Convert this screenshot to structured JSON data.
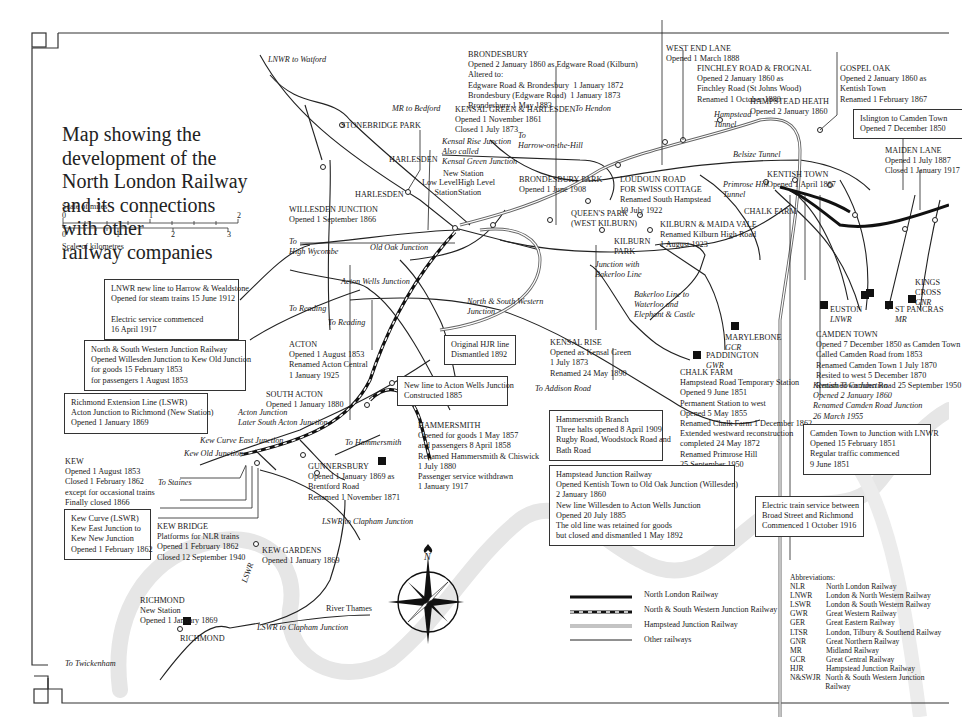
{
  "title": [
    "Map showing the",
    "development of the",
    "North London Railway",
    "and its connections",
    "with other",
    "railway companies"
  ],
  "scale": {
    "miles_label": "Scale of miles",
    "miles_ticks": [
      "0",
      "1",
      "2"
    ],
    "km_ticks": [
      "0",
      "1",
      "2",
      "3"
    ],
    "km_label": "Scale of kilometres"
  },
  "directions": {
    "lnwr_watford": "LNWR to Watford",
    "mr_bedford": "MR to Bedford",
    "to_hendon": "To Hendon",
    "to_harrow": "To\nHarrow-on-the-Hill",
    "to_high_wycombe": "To\nHigh Wycombe",
    "to_reading_1": "To Reading",
    "to_reading_2": "To Reading",
    "to_addison": "To Addison Road",
    "to_hammersmith": "To Hammersmith",
    "to_staines": "To Staines",
    "lswr_clapham_1": "LSWR to Clapham Junction",
    "lswr_clapham_2": "LSWR to Clapham Junction",
    "to_twickenham": "To Twickenham",
    "lswr_line": "LSWR",
    "bakerloo_waterloo": "Bakerloo Line to\nWaterloo and\nElephant & Castle",
    "junction_bakerloo": "Junction with\nBakerloo Line",
    "river": "River Thames",
    "compass_n": "N"
  },
  "junctions": {
    "kensal_rise_jn": "Kensal Rise Junction\nAlso called\nKensal Green Junction",
    "old_oak": "Old Oak Junction",
    "acton_wells": "Acton Wells Junction",
    "nsw_jn": "North & South Western\nJunction",
    "acton_jn": "Acton Junction\nLater South Acton Junction",
    "kew_curve_east": "Kew Curve East Junction",
    "kew_old": "Kew Old Junction",
    "hampstead_tunnel": "Hampstead\nTunnel",
    "belsize_tunnel": "Belsize Tunnel",
    "primrose_tunnel": "Primrose Hill\nTunnel",
    "kentish_town_jn": "Kentish Town Junction\nOpened 2 January 1860\nRenamed Camden Road Junction\n26 March 1955"
  },
  "stations": {
    "brondesbury": {
      "name": "BRONDESBURY",
      "text": "Opened 2 January 1860 as Edgware Road (Kilburn)\nAltered to:\nEdgware Road & Brondesbury  1 January 1872\nBrondesbury (Edgware Road)  1 January 1873\nBrondesbury 1 May 1883"
    },
    "west_end_lane": {
      "name": "WEST END LANE",
      "text": "Opened 1 March 1888"
    },
    "finchley_road": {
      "name": "FINCHLEY ROAD & FROGNAL",
      "text": "Opened 2 January 1860 as\nFinchley Road (St Johns Wood)\nRenamed 1 October 1880"
    },
    "gospel_oak": {
      "name": "GOSPEL OAK",
      "text": "Opened 2 January 1860 as\nKentish Town\nRenamed 1 February 1867"
    },
    "hampstead_heath": {
      "name": "HAMPSTEAD HEATH",
      "text": "Opened 2 January 1860"
    },
    "kensal_green": {
      "name": "KENSAL GREEN & HARLESDEN",
      "text": "Opened 1 November 1861\nClosed 1 July 1873"
    },
    "stonebridge": {
      "name": "STONEBRIDGE PARK",
      "text": ""
    },
    "harlesden_1": {
      "name": "HARLESDEN",
      "text": ""
    },
    "harlesden_2": {
      "name": "HARLESDEN",
      "text": ""
    },
    "new_station": {
      "name": "New Station",
      "text": ""
    },
    "low_level": {
      "name": "Low Level\nStation",
      "text": ""
    },
    "high_level": {
      "name": "High Level\nStation",
      "text": ""
    },
    "willesden": {
      "name": "WILLESDEN JUNCTION",
      "text": "Opened 1 September 1866"
    },
    "brondesbury_park": {
      "name": "BRONDESBURY PARK",
      "text": "Opened 1 June 1908"
    },
    "loudoun": {
      "name": "LOUDOUN ROAD\nFOR SWISS COTTAGE",
      "text": "Renamed South Hampstead\n10 July 1922"
    },
    "queens_park": {
      "name": "QUEEN'S PARK\n(WEST KILBURN)",
      "text": ""
    },
    "kilburn_park": {
      "name": "KILBURN\nPARK",
      "text": ""
    },
    "kilburn_maida": {
      "name": "KILBURN & MAIDA VALE",
      "text": "Renamed Kilburn High Road\n1 August 1923"
    },
    "kentish_town": {
      "name": "KENTISH TOWN",
      "text": "Opened 1 April 1867"
    },
    "chalk_farm_top": {
      "name": "CHALK FARM",
      "text": ""
    },
    "maiden_lane": {
      "name": "MAIDEN LANE",
      "text": "Opened 1 July 1887\nClosed 1 January 1917"
    },
    "kings_cross": {
      "name": "KINGS\nCROSS",
      "co": "GNR"
    },
    "st_pancras": {
      "name": "ST PANCRAS",
      "co": "MR"
    },
    "euston": {
      "name": "EUSTON",
      "co": "LNWR"
    },
    "marylebone": {
      "name": "MARYLEBONE",
      "co": "GCR"
    },
    "paddington": {
      "name": "PADDINGTON",
      "co": "GWR"
    },
    "camden_town": {
      "name": "CAMDEN TOWN",
      "text": "Opened 7 December 1850 as Camden Town\nCalled Camden Road from 1853\nRenamed Camden Town 1 July 1870\nResited to west 5 December 1870\nRenamed Camden Road 25 September 1950"
    },
    "chalk_farm": {
      "name": "CHALK FARM",
      "text": "Hampstead Road Temporary Station\nOpened 9 June 1851\nPermanent Station to west\nOpened 5 May 1855\nRenamed Chalk Farm 1 December 1862\nExtended westward reconstruction\ncompleted 24 May 1872\nRenamed Primrose Hill\n25 September 1950"
    },
    "kensal_rise": {
      "name": "KENSAL RISE",
      "text": "Opened as Kensal Green\n1 July 1873\nRenamed 24 May 1890"
    },
    "acton": {
      "name": "ACTON",
      "text": "Opened 1 August 1853\nRenamed Acton Central\n1 January 1925"
    },
    "south_acton": {
      "name": "SOUTH ACTON",
      "text": "Opened 1 January 1880"
    },
    "hammersmith": {
      "name": "HAMMERSMITH",
      "text": "Opened for goods 1 May 1857\nand passengers 8 April 1858\nRenamed Hammersmith & Chiswick\n1 July 1880\nPassenger service withdrawn\n1 January 1917"
    },
    "gunnersbury": {
      "name": "GUNNERSBURY",
      "text": "Opened 1 January 1869 as\nBrentford Road\nRenamed 1 November 1871"
    },
    "kew": {
      "name": "KEW",
      "text": "Opened 1 August 1853\nClosed 1 February 1862\nexcept for occasional trains\nFinally closed 1866"
    },
    "kew_bridge": {
      "name": "KEW BRIDGE",
      "text": "Platforms for NLR trains\nOpened 1 February 1862\nClosed 12 September 1940"
    },
    "kew_gardens": {
      "name": "KEW GARDENS",
      "text": "Opened 1 January 1869"
    },
    "richmond_new": {
      "name": "RICHMOND",
      "text": "New Station\nOpened 1 January 1869"
    },
    "richmond": {
      "name": "RICHMOND",
      "text": ""
    }
  },
  "boxes": {
    "lnwr_harrow": "LNWR new line to Harrow & Wealdstone\nOpened for steam trains 15 June 1912\n\nElectric service commenced\n16 April 1917",
    "nswjr": "North & South Western Junction Railway\nOpened Willesden Junction to Kew Old Junction\nfor goods 15 February 1853\nfor passengers 1 August 1853",
    "richmond_ext": "Richmond Extension Line (LSWR)\nActon Junction to Richmond (New Station)\nOpened 1 January 1869",
    "kew_curve": "Kew Curve (LSWR)\nKew East Junction to\nKew New Junction\nOpened 1 February 1862",
    "original_hjr": "Original HJR line\nDismantled 1892",
    "new_line_acton": "New line to Acton Wells Junction\nConstructed 1885",
    "hammersmith_branch": "Hammersmith Branch\nThree halts opened 8 April 1909\nRugby Road, Woodstock Road and\nBath Road",
    "hampstead_jr": "Hampstead Junction Railway\nOpened Kentish Town to Old Oak Junction (Willesden)\n2 January 1860\nNew line Willesden to Acton Wells Junction\nOpened 20 July 1885\nThe old line was retained for goods\nbut closed and dismantled 1 May 1892",
    "islington": "Islington to Camden Town\nOpened 7 December 1850",
    "camden_lnwr": "Camden Town to Junction with LNWR\nOpened 15 February 1851\nRegular traffic commenced\n9 June 1851",
    "electric": "Electric train service between\nBroad Street and Richmond\nCommenced 1 October 1916"
  },
  "legend": [
    {
      "label": "North London Railway",
      "style": "thick-black"
    },
    {
      "label": "North & South Western Junction Railway",
      "style": "dashed-black"
    },
    {
      "label": "Hampstead Junction Railway",
      "style": "double-grey"
    },
    {
      "label": "Other railways",
      "style": "thin-black"
    }
  ],
  "abbreviations": {
    "title": "Abbreviations:",
    "items": [
      {
        "k": "NLR",
        "v": "North London Railway"
      },
      {
        "k": "LNWR",
        "v": "London & North Western Railway"
      },
      {
        "k": "LSWR",
        "v": "London & South Western Railway"
      },
      {
        "k": "GWR",
        "v": "Great Western Railway"
      },
      {
        "k": "GER",
        "v": "Great Eastern Railway"
      },
      {
        "k": "LTSR",
        "v": "London, Tilbury & Southend Railway"
      },
      {
        "k": "GNR",
        "v": "Great Northern Railway"
      },
      {
        "k": "MR",
        "v": "Midland Railway"
      },
      {
        "k": "GCR",
        "v": "Great Central Railway"
      },
      {
        "k": "HJR",
        "v": "Hampstead Junction Railway"
      },
      {
        "k": "N&SWJR",
        "v": "North & South Western Junction Railway"
      }
    ]
  },
  "colors": {
    "ink": "#1a1a1a",
    "river": "#e4e4e4",
    "hjr": "#9a9a9a"
  }
}
